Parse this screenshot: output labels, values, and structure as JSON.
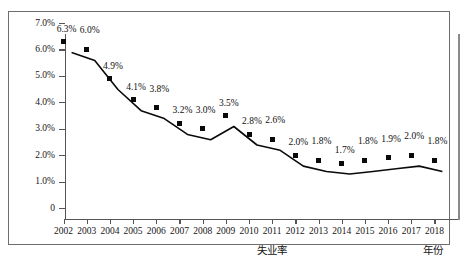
{
  "chart_data": {
    "type": "line",
    "title": "",
    "subtitle": "",
    "xlabel": "年份",
    "ylabel": "",
    "series_label": "失业率",
    "categories": [
      "2002",
      "2003",
      "2004",
      "2005",
      "2006",
      "2007",
      "2008",
      "2009",
      "2010",
      "2011",
      "2012",
      "2013",
      "2014",
      "2015",
      "2016",
      "2017",
      "2018"
    ],
    "x": [
      2002,
      2003,
      2004,
      2005,
      2006,
      2007,
      2008,
      2009,
      2010,
      2011,
      2012,
      2013,
      2014,
      2015,
      2016,
      2017,
      2018
    ],
    "values": [
      6.3,
      6.0,
      4.9,
      4.1,
      3.8,
      3.2,
      3.0,
      3.5,
      2.8,
      2.6,
      2.0,
      1.8,
      1.7,
      1.8,
      1.9,
      2.0,
      1.8
    ],
    "data_labels": [
      "6.3%",
      "6.0%",
      "4.9%",
      "4.1%",
      "3.8%",
      "3.2%",
      "3.0%",
      "3.5%",
      "2.8%",
      "2.6%",
      "2.0%",
      "1.8%",
      "1.7%",
      "1.8%",
      "1.9%",
      "2.0%",
      "1.8%"
    ],
    "ylim": [
      0,
      7.0
    ],
    "yticks": [
      0,
      1.0,
      2.0,
      3.0,
      4.0,
      5.0,
      6.0,
      7.0
    ],
    "ytick_labels": [
      "0",
      "1.0%",
      "2.0%",
      "3.0%",
      "4.0%",
      "5.0%",
      "6.0%",
      "7.0%"
    ],
    "grid": false,
    "legend": "none",
    "marker": "square",
    "line_color": "#0a0a0a",
    "marker_color": "#0a0a0a",
    "background_color": "#ffffff",
    "frame_color": "#6e6e6e"
  }
}
